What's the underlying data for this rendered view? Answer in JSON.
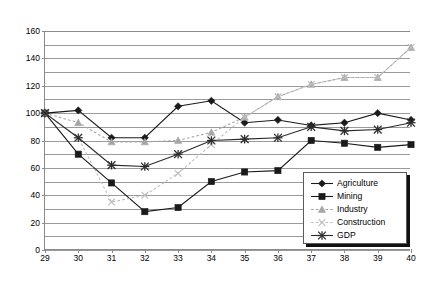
{
  "chart_data": {
    "type": "line",
    "title": "",
    "xlabel": "",
    "ylabel": "",
    "xlim": [
      29,
      40
    ],
    "ylim": [
      0,
      160
    ],
    "ytick_step": 20,
    "gridline_step": 10,
    "grid": true,
    "legend_position": "inside-bottom-right",
    "x": [
      29,
      30,
      31,
      32,
      33,
      34,
      35,
      36,
      37,
      38,
      39,
      40
    ],
    "xticklabels": [
      "29",
      "30",
      "31",
      "32",
      "33",
      "34",
      "35",
      "36",
      "37",
      "38",
      "39",
      "40"
    ],
    "yticklabels": [
      "0",
      "20",
      "40",
      "60",
      "80",
      "100",
      "120",
      "140",
      "160"
    ],
    "series": [
      {
        "name": "Agriculture",
        "marker": "diamond",
        "color": "#1a1a1a",
        "line": "solid",
        "values": [
          100,
          102,
          82,
          82,
          105,
          109,
          93,
          95,
          91,
          93,
          100,
          95
        ]
      },
      {
        "name": "Mining",
        "marker": "square",
        "color": "#1a1a1a",
        "line": "solid",
        "values": [
          100,
          70,
          49,
          28,
          31,
          50,
          57,
          58,
          80,
          78,
          75,
          77
        ]
      },
      {
        "name": "Industry",
        "marker": "triangle",
        "color": "#a6a6a6",
        "line": "dotted",
        "values": [
          100,
          93,
          79,
          79,
          80,
          86,
          97,
          112,
          121,
          126,
          126,
          148
        ]
      },
      {
        "name": "Construction",
        "marker": "cross",
        "color": "#bdbdbd",
        "line": "dotted",
        "values": [
          100,
          82,
          35,
          40,
          56,
          77,
          97,
          112,
          121,
          126,
          126,
          148
        ]
      },
      {
        "name": "GDP",
        "marker": "asterisk",
        "color": "#2b2b2b",
        "line": "solid",
        "values": [
          100,
          82,
          62,
          61,
          70,
          80,
          81,
          82,
          90,
          87,
          88,
          93
        ]
      }
    ]
  },
  "legend": {
    "items": [
      {
        "label": "Agriculture"
      },
      {
        "label": "Mining"
      },
      {
        "label": "Industry"
      },
      {
        "label": "Construction"
      },
      {
        "label": "GDP"
      }
    ]
  },
  "colors": {
    "axis": "#8a8a8a",
    "grid": "#9a9a9a",
    "background": "#ffffff",
    "legend_border": "#5a5a5a",
    "legend_shadow": "#111111"
  }
}
